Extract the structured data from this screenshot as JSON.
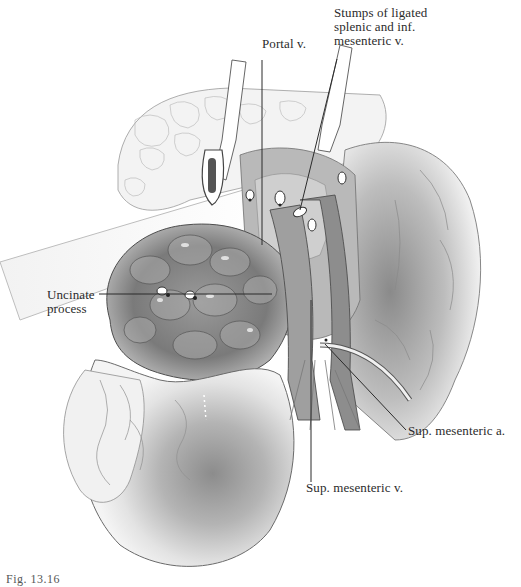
{
  "figure": {
    "labels": {
      "stumps": "Stumps of ligated\nsplenic and inf.\nmesenteric v.",
      "portal": "Portal v.",
      "uncinate": "Uncinate\nprocess",
      "sma": "Sup. mesenteric a.",
      "smv": "Sup. mesenteric v."
    },
    "caption": "Fig. 13.16"
  },
  "colors": {
    "ink": "#2b2b2b",
    "shade_dark": "#6f6f6f",
    "shade_mid": "#a8a8a8",
    "shade_light": "#d9d9d9",
    "paper": "#ffffff"
  }
}
